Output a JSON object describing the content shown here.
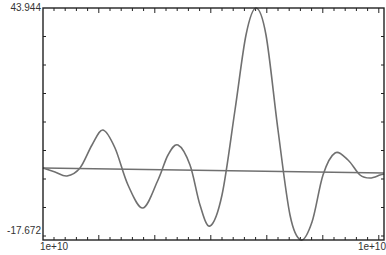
{
  "chart_data": {
    "type": "line",
    "title": "",
    "xlabel": "",
    "ylabel": "",
    "ylim": [
      -17.672,
      43.944
    ],
    "y_tick_labels": [
      "43.944",
      "-17.672"
    ],
    "x_tick_labels": [
      "1e+10",
      "1e+10"
    ],
    "grid": false,
    "legend": null,
    "series": [
      {
        "name": "signal",
        "color": "#707070",
        "points_px": [
          [
            43,
            168
          ],
          [
            55,
            172
          ],
          [
            67,
            176
          ],
          [
            80,
            168
          ],
          [
            92,
            145
          ],
          [
            103,
            130
          ],
          [
            115,
            148
          ],
          [
            128,
            185
          ],
          [
            143,
            208
          ],
          [
            158,
            180
          ],
          [
            168,
            155
          ],
          [
            178,
            145
          ],
          [
            190,
            165
          ],
          [
            200,
            205
          ],
          [
            210,
            226
          ],
          [
            222,
            195
          ],
          [
            235,
            110
          ],
          [
            246,
            35
          ],
          [
            256,
            8
          ],
          [
            266,
            35
          ],
          [
            278,
            130
          ],
          [
            290,
            215
          ],
          [
            301,
            240
          ],
          [
            312,
            222
          ],
          [
            323,
            175
          ],
          [
            335,
            153
          ],
          [
            348,
            160
          ],
          [
            360,
            175
          ],
          [
            370,
            178
          ],
          [
            380,
            175
          ],
          [
            384,
            174
          ]
        ],
        "values": [
          0.1,
          -1.0,
          -2.1,
          0.0,
          6.1,
          10.1,
          5.3,
          -4.5,
          -10.6,
          -3.2,
          3.5,
          6.1,
          0.8,
          -9.9,
          -15.5,
          -7.3,
          15.3,
          35.2,
          43.9,
          36.8,
          11.6,
          -11.0,
          -17.7,
          -12.9,
          -0.4,
          5.6,
          3.7,
          -0.3,
          -1.1,
          -0.3,
          0.0
        ]
      },
      {
        "name": "baseline",
        "color": "#707070",
        "points_px": [
          [
            43,
            168
          ],
          [
            384,
            173
          ]
        ],
        "values": [
          0.1,
          -1.2
        ]
      }
    ],
    "plot_area_px": {
      "left": 43,
      "top": 8,
      "right": 384,
      "bottom": 240
    }
  },
  "axes": {
    "y_top_label": "43.944",
    "y_bottom_label": "-17.672",
    "x_left_label": "1e+10",
    "x_right_label": "1e+10",
    "axis_color": "#222222",
    "line_color": "#707070"
  }
}
